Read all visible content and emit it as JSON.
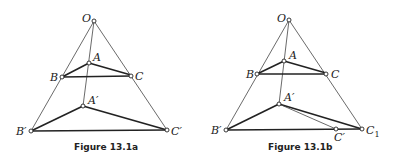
{
  "figures": [
    {
      "caption": "Figure 13.1a",
      "labels": {
        "O": "O",
        "A": "A",
        "B": "B",
        "C": "C",
        "A1": "A′",
        "B1": "B′",
        "C1": "C′"
      }
    },
    {
      "caption": "Figure 13.1b",
      "labels": {
        "O": "O",
        "A": "A",
        "B": "B",
        "C": "C",
        "A1": "A′",
        "B1": "B′",
        "C1": "C′",
        "Cx": "C",
        "Cx_sub": "1"
      }
    }
  ]
}
